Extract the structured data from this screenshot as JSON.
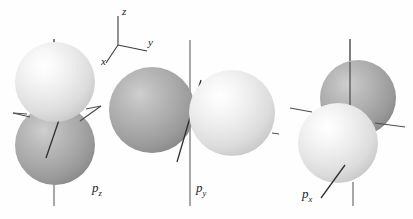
{
  "figure": {
    "background_color": "#fefefe",
    "width": 413,
    "height": 219
  },
  "axes_key": {
    "name": "coordinate-axes-key",
    "origin": {
      "x": 118,
      "y": 45
    },
    "labels": [
      {
        "id": "z",
        "text": "z",
        "x": 122,
        "y": 7
      },
      {
        "id": "y",
        "text": "y",
        "x": 148,
        "y": 39
      },
      {
        "id": "x",
        "text": "x",
        "x": 103,
        "y": 54
      }
    ],
    "lines": [
      {
        "id": "z-axis",
        "x1": 118,
        "y1": 45,
        "x2": 118,
        "y2": 16
      },
      {
        "id": "y-axis",
        "x1": 118,
        "y1": 45,
        "x2": 146,
        "y2": 51
      },
      {
        "id": "x-axis",
        "x1": 118,
        "y1": 45,
        "x2": 106,
        "y2": 62
      }
    ]
  },
  "colors": {
    "sphere_light_highlight": "#fdfdfd",
    "sphere_light_mid": "#e8e8e8",
    "sphere_light_edge": "#b9b9b9",
    "sphere_dark_highlight": "#c9c9c9",
    "sphere_dark_mid": "#a3a3a3",
    "sphere_dark_edge": "#777777",
    "axis_line": "#5a5a5a",
    "axis_line_dark": "#2c2c2c",
    "text": "#1c1c1c"
  },
  "orbitals": [
    {
      "id": "pz",
      "label_text": "p",
      "label_sub": "z",
      "label_x": 92,
      "label_y": 181,
      "description": "p-z orbital: light lobe above, dark lobe below, vertical z axis",
      "lobes": [
        {
          "id": "pz-upper-lobe",
          "shade": "light",
          "cx": 55,
          "cy": 82,
          "r": 40
        },
        {
          "id": "pz-lower-lobe",
          "shade": "dark",
          "cx": 55,
          "cy": 145,
          "r": 40
        }
      ]
    },
    {
      "id": "py",
      "label_text": "p",
      "label_sub": "y",
      "label_x": 196,
      "label_y": 181,
      "description": "p-y orbital: dark lobe at left, light lobe at right, vertical z axis through center",
      "lobes": [
        {
          "id": "py-left-lobe",
          "shade": "dark",
          "cx": 152,
          "cy": 110,
          "r": 43
        },
        {
          "id": "py-right-lobe",
          "shade": "light",
          "cx": 232,
          "cy": 113,
          "r": 43
        }
      ]
    },
    {
      "id": "px",
      "label_text": "p",
      "label_sub": "x",
      "label_x": 302,
      "label_y": 187,
      "description": "p-x orbital: dark lobe upper right, light lobe lower left, offset diagonally",
      "lobes": [
        {
          "id": "px-back-lobe",
          "shade": "dark",
          "cx": 358,
          "cy": 98,
          "r": 38
        },
        {
          "id": "px-front-lobe",
          "shade": "light",
          "cx": 338,
          "cy": 143,
          "r": 40
        }
      ]
    }
  ],
  "axis_lines": [
    {
      "id": "pz-z-axis-top",
      "x1": 54,
      "y1": 39,
      "x2": 54,
      "y2": 50
    },
    {
      "id": "pz-z-axis-bottom",
      "x1": 54,
      "y1": 185,
      "x2": 54,
      "y2": 205
    },
    {
      "id": "pz-y-axis-right",
      "x1": 87,
      "y1": 108,
      "x2": 101,
      "y2": 106
    },
    {
      "id": "pz-y-axis-left",
      "x1": 14,
      "y1": 113,
      "x2": 26,
      "y2": 114
    },
    {
      "id": "pz-x-axis",
      "x1": 48,
      "y1": 155,
      "x2": 58,
      "y2": 122
    },
    {
      "id": "py-z-axis",
      "x1": 190,
      "y1": 40,
      "x2": 190,
      "y2": 205
    },
    {
      "id": "py-y-axis-right",
      "x1": 272,
      "y1": 133,
      "x2": 278,
      "y2": 134
    },
    {
      "id": "py-x-axis",
      "x1": 178,
      "y1": 160,
      "x2": 200,
      "y2": 81
    },
    {
      "id": "px-z-axis-upper",
      "x1": 350,
      "y1": 40,
      "x2": 350,
      "y2": 105
    },
    {
      "id": "px-z-axis-lower",
      "x1": 353,
      "y1": 185,
      "x2": 353,
      "y2": 206
    },
    {
      "id": "px-y-axis-left",
      "x1": 291,
      "y1": 108,
      "x2": 307,
      "y2": 110
    },
    {
      "id": "px-y-axis-right",
      "x1": 385,
      "y1": 122,
      "x2": 404,
      "y2": 126
    },
    {
      "id": "px-x-axis",
      "x1": 322,
      "y1": 196,
      "x2": 344,
      "y2": 166
    }
  ]
}
